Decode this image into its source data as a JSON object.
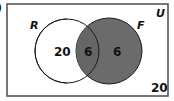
{
  "diagram": {
    "type": "venn",
    "partial_corner_label": ")",
    "universe": {
      "label": "U",
      "outside_value": "20"
    },
    "sets": [
      {
        "label": "R",
        "only_value": "20",
        "shaded": false
      },
      {
        "label": "F",
        "only_value": "6",
        "shaded": true
      }
    ],
    "intersection": {
      "value": "6",
      "shaded": true
    },
    "colors": {
      "shade": "#6b6b6b",
      "stroke": "#1a1a1a",
      "border": "#555555",
      "text": "#111111"
    }
  }
}
